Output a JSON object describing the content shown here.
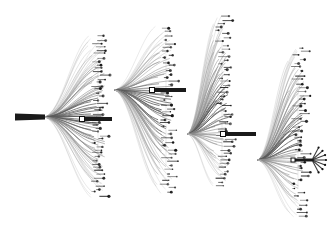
{
  "figure": {
    "title": "Hierarchical edge-bundled dendrogram",
    "type": "tree-diagram",
    "width": 336,
    "height": 225,
    "background_color": "#ffffff"
  },
  "style": {
    "background": "#ffffff",
    "filament_light": "#b3b3b3",
    "filament_mid": "#8a8a8a",
    "filament_dark": "#5a5a5a",
    "trunk_color": "#1a1a1a",
    "leaf_color": "#111111",
    "node_stroke": "#111111",
    "node_fill": "#ffffff"
  },
  "chart_data": {
    "type": "tree",
    "title": "Hierarchical edge-bundled dendrogram",
    "xlabel": "",
    "ylabel": "",
    "grid": false,
    "legend": false,
    "root": {
      "id": "root",
      "x": 15,
      "y": 117,
      "bar_length": 30,
      "bar_thickness": 7
    },
    "junctions": [
      {
        "id": "j1",
        "label": "junction-1",
        "x": 82,
        "y": 119,
        "marker": "hollow-square",
        "size": 5,
        "bar_to": 112,
        "bar_thickness": 4
      },
      {
        "id": "j2",
        "label": "junction-2",
        "x": 152,
        "y": 90,
        "marker": "hollow-square",
        "size": 5,
        "bar_to": 186,
        "bar_thickness": 4
      },
      {
        "id": "j3",
        "label": "junction-3",
        "x": 223,
        "y": 134,
        "marker": "hollow-square",
        "size": 5,
        "bar_to": 256,
        "bar_thickness": 4
      },
      {
        "id": "j4",
        "label": "terminal-node",
        "x": 293,
        "y": 160,
        "marker": "hollow-square",
        "size": 4,
        "bar_to": 312,
        "bar_thickness": 3
      }
    ],
    "clusters": [
      {
        "id": "c1",
        "label": "cluster-1",
        "origin_x": 45,
        "origin_y": 117,
        "fan_x": 105,
        "top_y": 36,
        "bottom_y": 196,
        "filament_count": 74,
        "leaf_count": 46,
        "leaf_column_x": 98
      },
      {
        "id": "c2",
        "label": "cluster-2",
        "origin_x": 115,
        "origin_y": 90,
        "fan_x": 172,
        "top_y": 28,
        "bottom_y": 192,
        "filament_count": 70,
        "leaf_count": 44,
        "leaf_column_x": 166
      },
      {
        "id": "c3",
        "label": "cluster-3",
        "origin_x": 188,
        "origin_y": 134,
        "fan_x": 232,
        "top_y": 16,
        "bottom_y": 186,
        "filament_count": 72,
        "leaf_count": 48,
        "leaf_column_x": 222
      },
      {
        "id": "c4",
        "label": "cluster-4",
        "origin_x": 258,
        "origin_y": 160,
        "fan_x": 304,
        "top_y": 48,
        "bottom_y": 216,
        "filament_count": 68,
        "leaf_count": 44,
        "leaf_column_x": 298
      }
    ],
    "terminal_burst": {
      "label": "terminal-fan",
      "x": 312,
      "y": 160,
      "branch_count": 7,
      "radius": 14
    },
    "totals": {
      "clusters": 4,
      "junction_nodes": 4,
      "approx_filaments": 284,
      "approx_leaves": 182
    }
  }
}
